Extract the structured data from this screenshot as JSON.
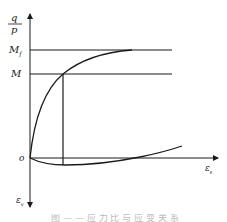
{
  "diagram": {
    "y_axis_label_num": "q",
    "y_axis_label_den": "p",
    "x_axis_label": "εs",
    "x_axis_label_base": "ε",
    "x_axis_label_sub": "s",
    "neg_y_axis_label_base": "ε",
    "neg_y_axis_label_sub": "v",
    "origin_label": "o",
    "level_labels": {
      "upper_base": "M",
      "upper_sub": "f",
      "lower": "M"
    },
    "colors": {
      "line": "#1a1a1a",
      "background": "#ffffff",
      "caption": "#bbbbbb"
    }
  },
  "caption": "图 — — 应 力 比 与 应 变 关 系"
}
